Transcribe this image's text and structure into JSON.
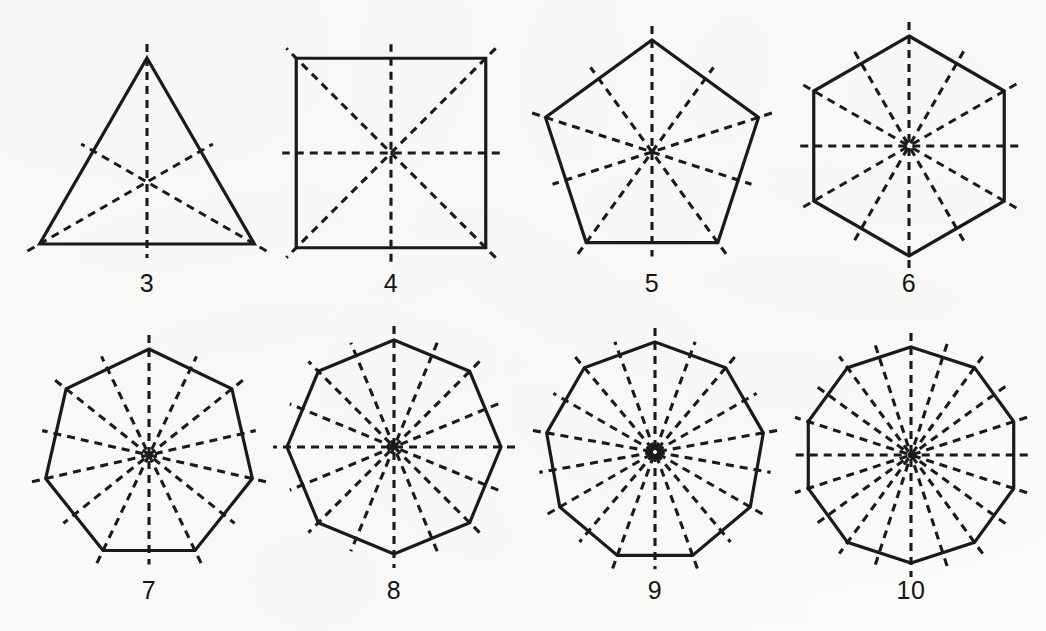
{
  "page": {
    "width": 1046,
    "height": 631,
    "background_color": "#fbfbfa",
    "ink_color": "#1a1a1a"
  },
  "style": {
    "outline_stroke_width": 3.2,
    "symmetry_stroke_width": 3.1,
    "dash_pattern": "8 6",
    "symmetry_overhang_px": 14,
    "label_font_size": 25
  },
  "figures": [
    {
      "id": "triangle",
      "sides": 3,
      "label": "3",
      "center_x": 147,
      "center_y": 182,
      "radius": 124,
      "rotation_deg": 0,
      "label_x": 147,
      "label_y": 271,
      "symmetry_lines": 3
    },
    {
      "id": "square",
      "sides": 4,
      "label": "4",
      "center_x": 391,
      "center_y": 153,
      "radius": 134,
      "rotation_deg": 45,
      "label_x": 391,
      "label_y": 271,
      "symmetry_lines": 4
    },
    {
      "id": "pentagon",
      "sides": 5,
      "label": "5",
      "center_x": 652,
      "center_y": 152,
      "radius": 112,
      "rotation_deg": 0,
      "label_x": 652,
      "label_y": 271,
      "symmetry_lines": 5
    },
    {
      "id": "hexagon",
      "sides": 6,
      "label": "6",
      "center_x": 909,
      "center_y": 146,
      "radius": 110,
      "rotation_deg": 0,
      "label_x": 909,
      "label_y": 271,
      "symmetry_lines": 6
    },
    {
      "id": "heptagon",
      "sides": 7,
      "label": "7",
      "center_x": 149,
      "center_y": 455,
      "radius": 106,
      "rotation_deg": 0,
      "label_x": 149,
      "label_y": 578,
      "symmetry_lines": 7
    },
    {
      "id": "octagon",
      "sides": 8,
      "label": "8",
      "center_x": 394,
      "center_y": 447,
      "radius": 107,
      "rotation_deg": 0,
      "label_x": 394,
      "label_y": 578,
      "symmetry_lines": 8
    },
    {
      "id": "nonagon",
      "sides": 9,
      "label": "9",
      "center_x": 655,
      "center_y": 452,
      "radius": 110,
      "rotation_deg": 0,
      "label_x": 655,
      "label_y": 578,
      "symmetry_lines": 9
    },
    {
      "id": "decagon",
      "sides": 10,
      "label": "10",
      "center_x": 911,
      "center_y": 455,
      "radius": 108,
      "rotation_deg": 0,
      "label_x": 911,
      "label_y": 578,
      "symmetry_lines": 10
    }
  ]
}
